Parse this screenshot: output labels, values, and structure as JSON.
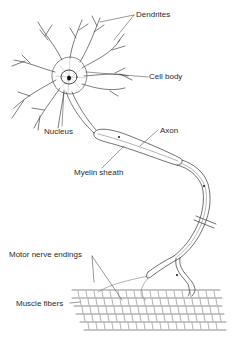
{
  "diagram": {
    "labels": {
      "dendrites": "Dendrites",
      "cell_body": "Cell body",
      "nucleus": "Nucleus",
      "axon": "Axon",
      "myelin_sheath": "Myelin sheath",
      "motor_nerve_endings": "Motor nerve endings",
      "muscle_fibers": "Muscle fibers"
    },
    "colors": {
      "ink": "#333333",
      "background": "#ffffff"
    }
  }
}
